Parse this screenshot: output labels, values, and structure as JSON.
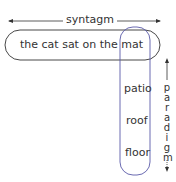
{
  "title": "syntagm",
  "syntagm": {
    "label": "syntagm",
    "words": [
      "the",
      "cat",
      "sat",
      "on",
      "the",
      "mat"
    ],
    "sentence": "the cat sat on the mat"
  },
  "paradigm": {
    "label": "paradigm",
    "letters": [
      "p",
      "a",
      "r",
      "a",
      "d",
      "i",
      "g",
      "m"
    ],
    "alternatives": [
      "mat",
      "patio",
      "roof",
      "floor"
    ]
  },
  "colors": {
    "syntagm_box": "#333333",
    "paradigm_box": "#5a5aa8",
    "text": "#333333"
  }
}
